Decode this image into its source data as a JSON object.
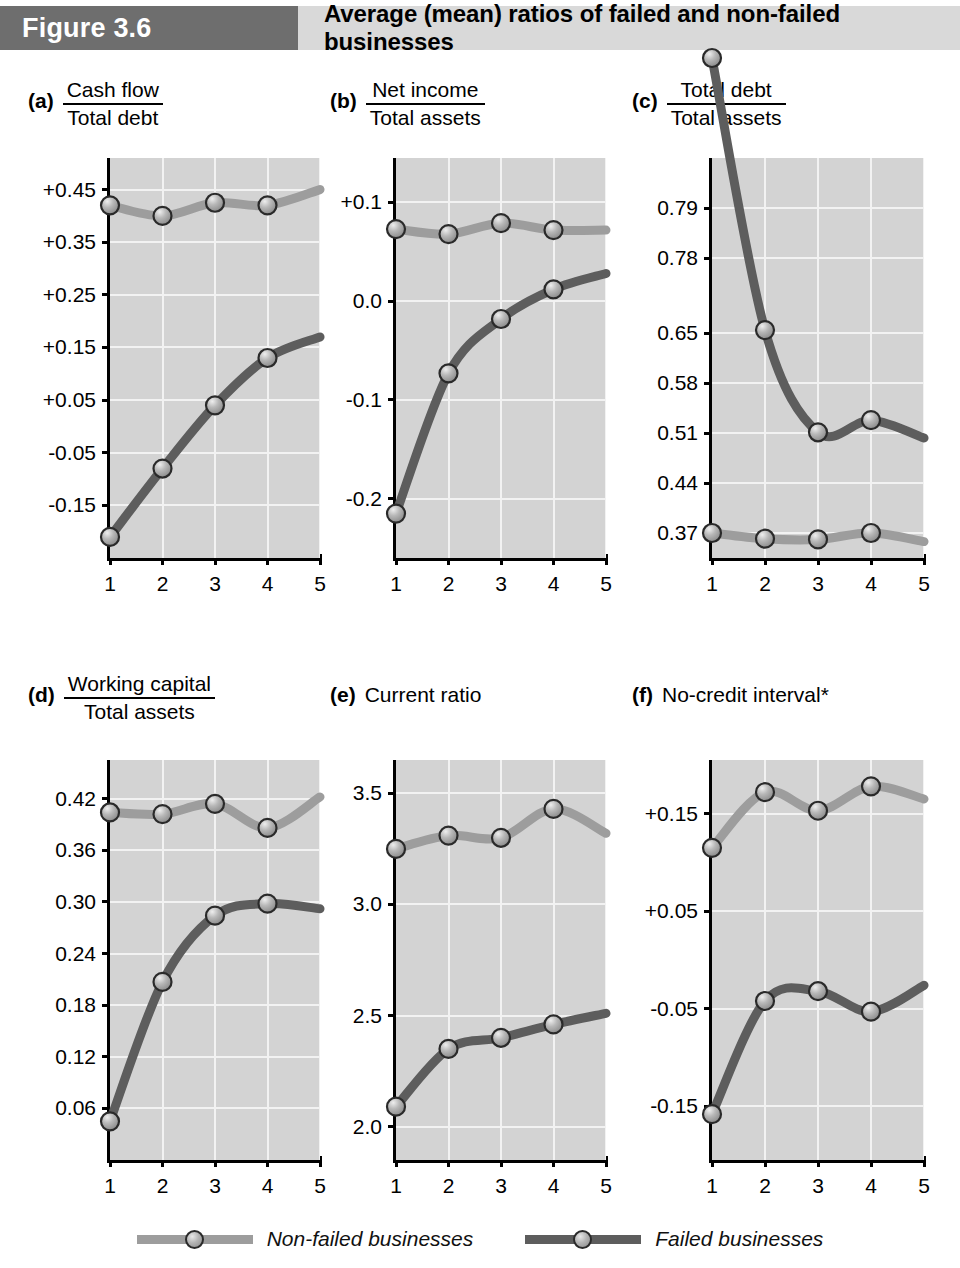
{
  "header": {
    "figure_label": "Figure 3.6",
    "title": "Average (mean) ratios of failed and non-failed businesses",
    "badge_color": "#6e6e6e",
    "bar_color": "#d9d9d9"
  },
  "legend": {
    "items": [
      {
        "label": "Non-failed businesses",
        "color": "#9d9d9d"
      },
      {
        "label": "Failed businesses",
        "color": "#5d5d5d"
      }
    ]
  },
  "series_colors": {
    "non_failed": "#9d9d9d",
    "failed": "#5d5d5d"
  },
  "chart_data": [
    {
      "type": "line",
      "panel": "a",
      "tag": "(a)",
      "title_numerator": "Cash flow",
      "title_denominator": "Total debt",
      "title": "Cash flow / Total debt",
      "xlabel": "",
      "ylabel": "",
      "x": [
        1,
        2,
        3,
        4,
        5
      ],
      "categories": [
        "1",
        "2",
        "3",
        "4",
        "5"
      ],
      "yticks": [
        "+0.45",
        "+0.35",
        "+0.25",
        "+0.15",
        "+0.05",
        "-0.05",
        "-0.15"
      ],
      "ytick_values": [
        0.45,
        0.35,
        0.25,
        0.15,
        0.05,
        -0.05,
        -0.15
      ],
      "ylim": [
        -0.25,
        0.51
      ],
      "grid": true,
      "series": [
        {
          "name": "Non-failed businesses",
          "values": [
            0.42,
            0.4,
            0.425,
            0.42,
            0.45
          ]
        },
        {
          "name": "Failed businesses",
          "values": [
            -0.21,
            -0.08,
            0.04,
            0.13,
            0.17
          ]
        }
      ]
    },
    {
      "type": "line",
      "panel": "b",
      "tag": "(b)",
      "title_numerator": "Net income",
      "title_denominator": "Total assets",
      "title": "Net income / Total assets",
      "xlabel": "",
      "ylabel": "",
      "x": [
        1,
        2,
        3,
        4,
        5
      ],
      "categories": [
        "1",
        "2",
        "3",
        "4",
        "5"
      ],
      "yticks": [
        "+0.1",
        "0.0",
        "-0.1",
        "-0.2"
      ],
      "ytick_values": [
        0.1,
        0.0,
        -0.1,
        -0.2
      ],
      "ylim": [
        -0.26,
        0.145
      ],
      "grid": true,
      "series": [
        {
          "name": "Non-failed businesses",
          "values": [
            0.073,
            0.068,
            0.079,
            0.072,
            0.072
          ]
        },
        {
          "name": "Failed businesses",
          "values": [
            -0.215,
            -0.073,
            -0.018,
            0.012,
            0.028
          ]
        }
      ]
    },
    {
      "type": "line",
      "panel": "c",
      "tag": "(c)",
      "title_numerator": "Total debt",
      "title_denominator": "Total assets",
      "title": "Total debt / Total assets",
      "xlabel": "",
      "ylabel": "",
      "x": [
        1,
        2,
        3,
        4,
        5
      ],
      "categories": [
        "1",
        "2",
        "3",
        "4",
        "5"
      ],
      "yticks": [
        "0.79",
        "0.78",
        "0.65",
        "0.58",
        "0.51",
        "0.44",
        "0.37"
      ],
      "ytick_values": [
        0.79,
        0.78,
        0.65,
        0.58,
        0.51,
        0.44,
        0.37
      ],
      "ytick_positions": [
        0.875,
        0.75,
        0.5625,
        0.4375,
        0.3125,
        0.1875,
        0.0625
      ],
      "grid": true,
      "series": [
        {
          "name": "Non-failed businesses",
          "values": [
            0.37,
            0.362,
            0.361,
            0.37,
            0.358
          ]
        },
        {
          "name": "Failed businesses",
          "values": [
            0.82,
            0.655,
            0.511,
            0.528,
            0.503
          ]
        }
      ]
    },
    {
      "type": "line",
      "panel": "d",
      "tag": "(d)",
      "title_numerator": "Working capital",
      "title_denominator": "Total assets",
      "title": "Working capital / Total assets",
      "xlabel": "",
      "ylabel": "",
      "x": [
        1,
        2,
        3,
        4,
        5
      ],
      "categories": [
        "1",
        "2",
        "3",
        "4",
        "5"
      ],
      "yticks": [
        "0.42",
        "0.36",
        "0.30",
        "0.24",
        "0.18",
        "0.12",
        "0.06"
      ],
      "ytick_values": [
        0.42,
        0.36,
        0.3,
        0.24,
        0.18,
        0.12,
        0.06
      ],
      "ylim": [
        0.0,
        0.465
      ],
      "grid": true,
      "series": [
        {
          "name": "Non-failed businesses",
          "values": [
            0.404,
            0.402,
            0.414,
            0.386,
            0.422
          ]
        },
        {
          "name": "Failed businesses",
          "values": [
            0.045,
            0.207,
            0.284,
            0.298,
            0.292
          ]
        }
      ]
    },
    {
      "type": "line",
      "panel": "e",
      "tag": "(e)",
      "title_plain": "Current ratio",
      "title": "Current ratio",
      "xlabel": "",
      "ylabel": "",
      "x": [
        1,
        2,
        3,
        4,
        5
      ],
      "categories": [
        "1",
        "2",
        "3",
        "4",
        "5"
      ],
      "yticks": [
        "3.5",
        "3.0",
        "2.5",
        "2.0"
      ],
      "ytick_values": [
        3.5,
        3.0,
        2.5,
        2.0
      ],
      "ylim": [
        1.85,
        3.65
      ],
      "grid": true,
      "series": [
        {
          "name": "Non-failed businesses",
          "values": [
            3.25,
            3.31,
            3.3,
            3.43,
            3.32
          ]
        },
        {
          "name": "Failed businesses",
          "values": [
            2.09,
            2.35,
            2.4,
            2.46,
            2.51
          ]
        }
      ]
    },
    {
      "type": "line",
      "panel": "f",
      "tag": "(f)",
      "title_plain": "No-credit interval*",
      "title": "No-credit interval*",
      "xlabel": "",
      "ylabel": "",
      "x": [
        1,
        2,
        3,
        4,
        5
      ],
      "categories": [
        "1",
        "2",
        "3",
        "4",
        "5"
      ],
      "yticks": [
        "+0.15",
        "+0.05",
        "-0.05",
        "-0.15"
      ],
      "ytick_values": [
        0.15,
        0.05,
        -0.05,
        -0.15
      ],
      "ylim": [
        -0.205,
        0.205
      ],
      "grid": true,
      "series": [
        {
          "name": "Non-failed businesses",
          "values": [
            0.115,
            0.172,
            0.153,
            0.178,
            0.165
          ]
        },
        {
          "name": "Failed businesses",
          "values": [
            -0.158,
            -0.042,
            -0.032,
            -0.053,
            -0.026
          ]
        }
      ]
    }
  ]
}
